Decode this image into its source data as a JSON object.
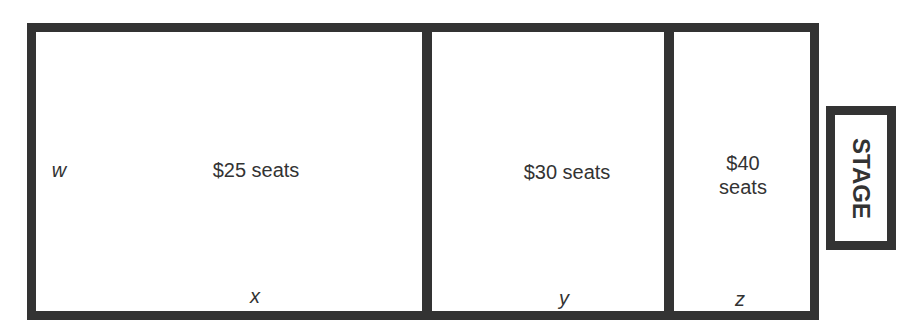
{
  "sections": [
    {
      "label": "$25 seats",
      "variable": "x"
    },
    {
      "label": "$30 seats",
      "variable": "y"
    },
    {
      "label_line1": "$40",
      "label_line2": "seats",
      "variable": "z"
    }
  ],
  "side_variable": "w",
  "stage_label": "STAGE"
}
